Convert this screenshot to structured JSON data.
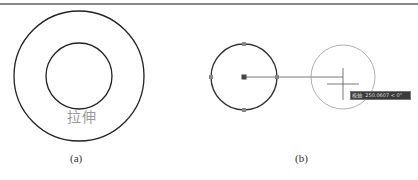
{
  "figure_a": {
    "label": "拉伸",
    "caption": "(a)",
    "outer_circle": {
      "cx": 79,
      "cy": 76,
      "r": 65
    },
    "inner_circle": {
      "cx": 79,
      "cy": 76,
      "r": 33
    }
  },
  "figure_b": {
    "caption": "(b)",
    "selected_circle": {
      "cx": 244,
      "cy": 77,
      "r": 33
    },
    "grips": [
      "center",
      "top",
      "bottom",
      "left",
      "right"
    ],
    "rubber_band_line": {
      "x1": 244,
      "y1": 77,
      "x2": 343,
      "y2": 77
    },
    "preview_circle": {
      "cx": 343,
      "cy": 77,
      "r": 32
    },
    "crosshair": {
      "x": 343,
      "y": 81
    },
    "tooltip_text": "极轴: 250.0607 < 0°"
  },
  "colors": {
    "line": "#222222",
    "preview": "#888888",
    "grip": "#7a7a7a",
    "label": "#9a9a9a"
  }
}
